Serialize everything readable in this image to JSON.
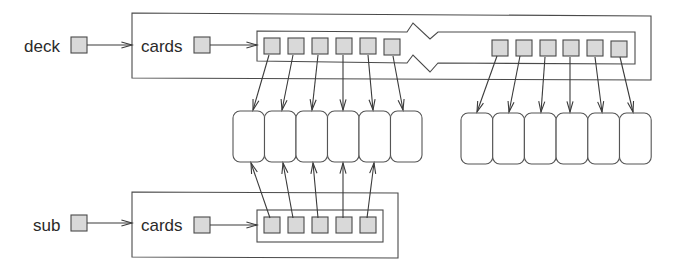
{
  "diagram": {
    "title": "",
    "colors": {
      "cell_fill": "#d9d9d9",
      "line": "#4a4a4a",
      "card_fill": "#ffffff"
    },
    "variables": [
      {
        "id": "deck",
        "label": "deck",
        "label_x": 24,
        "label_y": 52,
        "ptr": {
          "x": 71,
          "y": 37,
          "w": 16,
          "h": 16
        },
        "arrow": {
          "x1": 87,
          "y1": 45,
          "x2": 132,
          "y2": 45
        }
      },
      {
        "id": "sub",
        "label": "sub",
        "label_x": 33,
        "label_y": 231,
        "ptr": {
          "x": 71,
          "y": 215,
          "w": 16,
          "h": 16
        },
        "arrow": {
          "x1": 87,
          "y1": 223,
          "x2": 132,
          "y2": 223
        }
      }
    ],
    "objects": [
      {
        "id": "deck-object",
        "field_label": "cards",
        "outer_path": "M132,13 L410,14.5 M438,15 L651,16 L651,80 L438,79.5 M410,79 L132,78 Z",
        "outer_box": {
          "x": 132,
          "y": 13,
          "right": 651,
          "bottom": 80
        },
        "label_x": 141,
        "label_y": 52,
        "ptr": {
          "x": 194,
          "y": 37,
          "w": 16,
          "h": 16
        },
        "arrow": {
          "x1": 210,
          "y1": 45,
          "x2": 257,
          "y2": 45
        },
        "array_path": "M257,31 L257,61 L407,63 L413,55 L430,72 L438,63 L635,64 L635,32 L438,32 L430,39 L413,23 L407,32 Z",
        "cells": [
          {
            "x": 264,
            "y": 38
          },
          {
            "x": 288,
            "y": 38
          },
          {
            "x": 312,
            "y": 38
          },
          {
            "x": 336,
            "y": 38
          },
          {
            "x": 360,
            "y": 38
          },
          {
            "x": 384,
            "y": 39
          },
          {
            "x": 492,
            "y": 40
          },
          {
            "x": 516,
            "y": 40
          },
          {
            "x": 540,
            "y": 40
          },
          {
            "x": 563,
            "y": 40
          },
          {
            "x": 587,
            "y": 40
          },
          {
            "x": 611,
            "y": 41
          }
        ],
        "cell_size": 16
      },
      {
        "id": "sub-object",
        "field_label": "cards",
        "outer_box": {
          "x": 132,
          "y": 192,
          "right": 398,
          "bottom": 258
        },
        "label_x": 141,
        "label_y": 231,
        "ptr": {
          "x": 194,
          "y": 217,
          "w": 16,
          "h": 16
        },
        "arrow": {
          "x1": 210,
          "y1": 225,
          "x2": 257,
          "y2": 225
        },
        "array_box": {
          "x": 257,
          "y": 210,
          "right": 383,
          "bottom": 242
        },
        "cells": [
          {
            "x": 264,
            "y": 217
          },
          {
            "x": 288,
            "y": 217
          },
          {
            "x": 312,
            "y": 217
          },
          {
            "x": 336,
            "y": 217
          },
          {
            "x": 360,
            "y": 217
          }
        ],
        "cell_size": 16
      }
    ],
    "card_groups": [
      {
        "id": "cards-left",
        "x": 233,
        "y": 111,
        "count": 6,
        "w": 31.5,
        "h": 51,
        "rx": 7
      },
      {
        "id": "cards-right",
        "x": 461,
        "y": 113,
        "count": 6,
        "w": 31.7,
        "h": 51,
        "rx": 7
      }
    ],
    "references": [
      {
        "from": [
          269,
          55
        ],
        "to": [
          253,
          110
        ]
      },
      {
        "from": [
          293,
          55
        ],
        "to": [
          282,
          110
        ]
      },
      {
        "from": [
          318,
          55
        ],
        "to": [
          312,
          110
        ]
      },
      {
        "from": [
          343,
          55
        ],
        "to": [
          343,
          110
        ]
      },
      {
        "from": [
          368,
          55
        ],
        "to": [
          373,
          110
        ]
      },
      {
        "from": [
          393,
          56
        ],
        "to": [
          403,
          110
        ]
      },
      {
        "from": [
          497,
          56
        ],
        "to": [
          477,
          112
        ]
      },
      {
        "from": [
          520,
          56
        ],
        "to": [
          509,
          112
        ]
      },
      {
        "from": [
          545,
          57
        ],
        "to": [
          541,
          112
        ]
      },
      {
        "from": [
          570,
          57
        ],
        "to": [
          570,
          112
        ]
      },
      {
        "from": [
          595,
          57
        ],
        "to": [
          602,
          112
        ]
      },
      {
        "from": [
          620,
          57
        ],
        "to": [
          633,
          112
        ]
      },
      {
        "from": [
          270,
          218
        ],
        "to": [
          251,
          163
        ]
      },
      {
        "from": [
          293,
          218
        ],
        "to": [
          283,
          163
        ]
      },
      {
        "from": [
          318,
          218
        ],
        "to": [
          313,
          163
        ]
      },
      {
        "from": [
          343,
          218
        ],
        "to": [
          343,
          163
        ]
      },
      {
        "from": [
          367,
          218
        ],
        "to": [
          374,
          163
        ]
      }
    ]
  }
}
